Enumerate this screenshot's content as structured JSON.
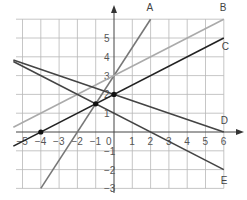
{
  "chart_data": {
    "type": "line",
    "title": "",
    "xlabel": "",
    "ylabel": "",
    "xlim": [
      -5.5,
      6
    ],
    "ylim": [
      -3,
      6
    ],
    "grid": true,
    "x_ticks": [
      "-5",
      "-4",
      "-3",
      "-2",
      "-1",
      "1",
      "2",
      "3",
      "4",
      "5",
      "6"
    ],
    "x_tick_values": [
      -5,
      -4,
      -3,
      -2,
      -1,
      1,
      2,
      3,
      4,
      5,
      6
    ],
    "y_ticks": [
      "5",
      "4",
      "3",
      "2",
      "1",
      "1",
      "2",
      "3"
    ],
    "y_tick_values": [
      5,
      4,
      3,
      2,
      1,
      -1,
      -2,
      -3
    ],
    "origin_label": "0",
    "series": [
      {
        "name": "A",
        "color": "#777777",
        "points": [
          [
            -4,
            -3
          ],
          [
            2,
            6
          ]
        ],
        "equation": "y = 1.5x + 3"
      },
      {
        "name": "B",
        "color": "#aaaaaa",
        "points": [
          [
            -5.5,
            0.25
          ],
          [
            6,
            6
          ]
        ],
        "equation": "y = 0.5x + 3"
      },
      {
        "name": "C",
        "color": "#222222",
        "points": [
          [
            -5.5,
            -0.75
          ],
          [
            6,
            5
          ]
        ],
        "equation": "y = 0.5x + 2"
      },
      {
        "name": "D",
        "color": "#444444",
        "points": [
          [
            -5.5,
            3.83
          ],
          [
            6,
            0
          ]
        ],
        "equation": "y = -x/3 + 2"
      },
      {
        "name": "E",
        "color": "#444444",
        "points": [
          [
            -5.5,
            3.75
          ],
          [
            6,
            -2
          ]
        ],
        "equation": "y = -0.5x + 1"
      }
    ],
    "marked_points": [
      [
        -4,
        0
      ],
      [
        -1,
        1.5
      ],
      [
        0,
        2
      ]
    ]
  }
}
